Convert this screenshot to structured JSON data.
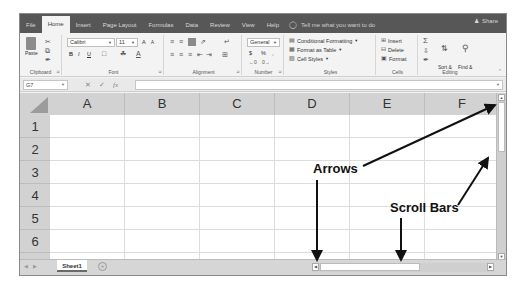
{
  "tabs": {
    "items": [
      "File",
      "Home",
      "Insert",
      "Page Layout",
      "Formulas",
      "Data",
      "Review",
      "View",
      "Help"
    ],
    "active": "Home",
    "tell_me": "Tell me what you want to do",
    "share": "Share"
  },
  "ribbon": {
    "clipboard": {
      "label": "Clipboard",
      "paste": "Paste"
    },
    "font": {
      "label": "Font",
      "name": "Calibri",
      "size": "11",
      "bold": "B",
      "italic": "I",
      "underline": "U",
      "grow": "A",
      "shrink": "A"
    },
    "alignment": {
      "label": "Alignment"
    },
    "number": {
      "label": "Number",
      "format": "General",
      "currency": "$",
      "percent": "%",
      "comma": ","
    },
    "styles": {
      "label": "Styles",
      "conditional": "Conditional Formatting",
      "format_table": "Format as Table",
      "cell_styles": "Cell Styles"
    },
    "cells": {
      "label": "Cells",
      "insert": "Insert",
      "delete": "Delete",
      "format": "Format"
    },
    "editing": {
      "label": "Editing",
      "sort_filter_1": "Sort &",
      "sort_filter_2": "Filter",
      "find_select_1": "Find &",
      "find_select_2": "Select"
    }
  },
  "formula_bar": {
    "name_box": "G7",
    "cancel": "✕",
    "enter": "✓",
    "fx": "fx",
    "value": ""
  },
  "grid": {
    "columns": [
      "A",
      "B",
      "C",
      "D",
      "E",
      "F"
    ],
    "rows": [
      "1",
      "2",
      "3",
      "4",
      "5",
      "6"
    ]
  },
  "sheets": {
    "tabs": [
      "Sheet1"
    ],
    "add": "+"
  },
  "annotations": {
    "arrows_label": "Arrows",
    "scroll_bars_label": "Scroll Bars"
  }
}
